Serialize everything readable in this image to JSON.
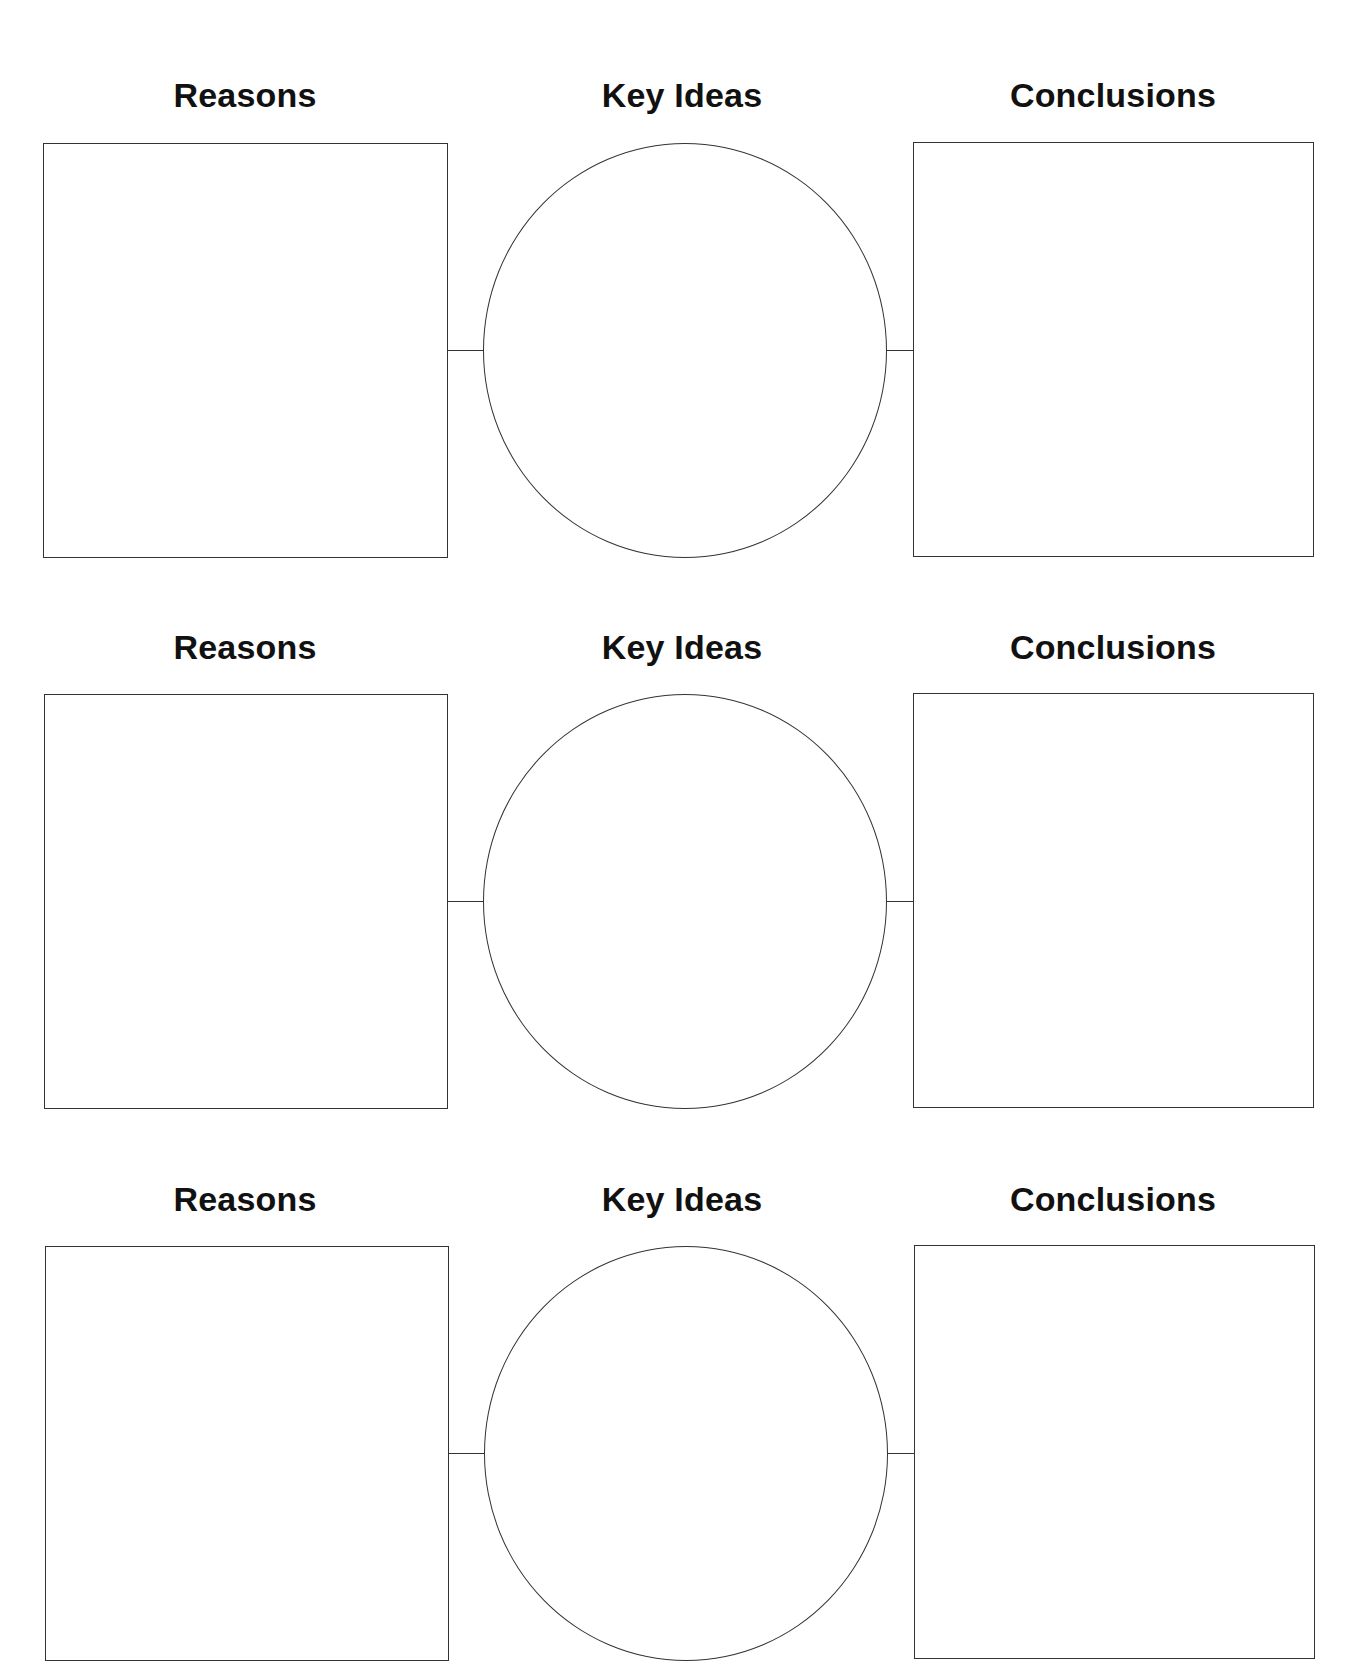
{
  "page": {
    "clipped_header_text": "",
    "rows": [
      {
        "left_label": "Reasons",
        "center_label": "Key Ideas",
        "right_label": "Conclusions"
      },
      {
        "left_label": "Reasons",
        "center_label": "Key Ideas",
        "right_label": "Conclusions"
      },
      {
        "left_label": "Reasons",
        "center_label": "Key Ideas",
        "right_label": "Conclusions"
      }
    ]
  },
  "colors": {
    "line": "#333333",
    "text": "#111111",
    "background": "#ffffff"
  }
}
